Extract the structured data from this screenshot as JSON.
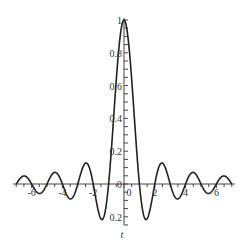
{
  "chart_data": {
    "type": "line",
    "title": "",
    "xlabel": "t",
    "ylabel": "",
    "xlim": [
      -7.2,
      7.2
    ],
    "ylim": [
      -0.25,
      1.0
    ],
    "grid": false,
    "legend": null,
    "x_ticks": [
      -6,
      -4,
      -2,
      0,
      2,
      4,
      6
    ],
    "x_tick_labels": [
      "-6",
      "-4",
      "-2",
      "0",
      "2",
      "4",
      "6"
    ],
    "y_ticks": [
      -0.2,
      0,
      0.2,
      0.4,
      0.6,
      0.8,
      1
    ],
    "y_tick_labels": [
      "0.2",
      "0",
      "0.2",
      "0.4",
      "0.6",
      "0.8",
      "1"
    ],
    "series": [
      {
        "name": "sin(pi t)/(pi t)",
        "function": "sinc",
        "x": [
          -7,
          -6.5,
          -6,
          -5.5,
          -5,
          -4.5,
          -4,
          -3.5,
          -3,
          -2.5,
          -2,
          -1.5,
          -1.43,
          -1,
          -0.5,
          0,
          0.5,
          1,
          1.43,
          1.5,
          2,
          2.5,
          3,
          3.5,
          4,
          4.5,
          5,
          5.5,
          6,
          6.5,
          7
        ],
        "y": [
          0,
          0.049,
          0,
          -0.058,
          0,
          0.071,
          0,
          -0.091,
          0,
          0.127,
          0,
          -0.212,
          -0.217,
          0,
          0.637,
          1,
          0.637,
          0,
          -0.217,
          -0.212,
          0,
          0.127,
          0,
          -0.091,
          0,
          0.071,
          0,
          -0.058,
          0,
          0.049,
          0
        ]
      }
    ]
  },
  "axes": {
    "x_label": "t",
    "x_tick_labels": [
      "-6",
      "-4",
      "-2",
      "0",
      "2",
      "4",
      "6"
    ],
    "y_tick_labels": [
      "0.2",
      "0",
      "0.2",
      "0.4",
      "0.6",
      "0.8",
      "1"
    ]
  },
  "colors": {
    "curve": "#222222",
    "axis": "#444444"
  }
}
